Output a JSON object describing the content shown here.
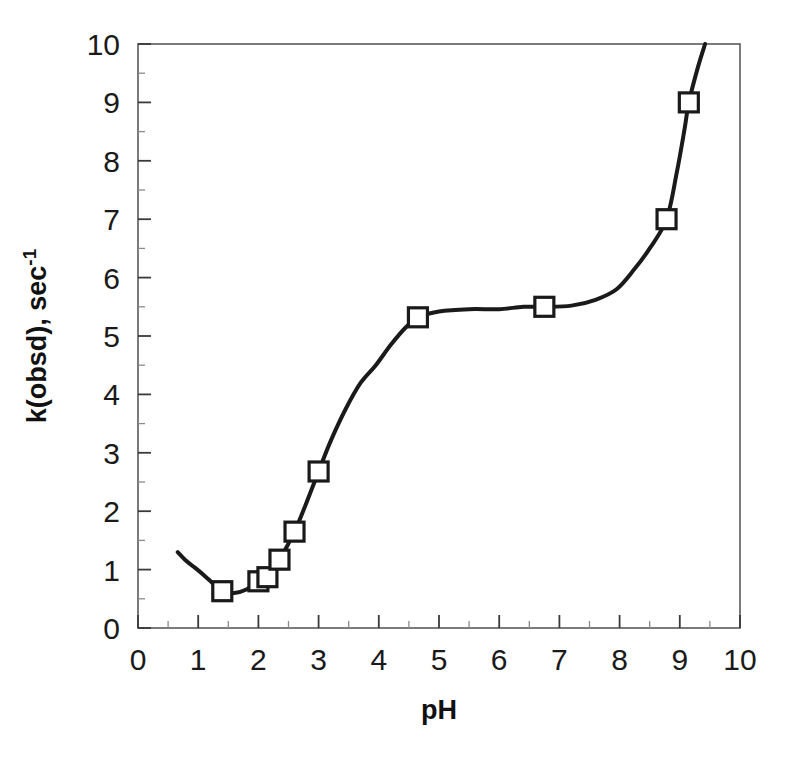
{
  "chart_data": {
    "type": "line",
    "title": "",
    "subtitle": "",
    "xlabel": "pH",
    "ylabel": "k(obsd), sec",
    "ylabel_superscript": "-1",
    "xlim": [
      0,
      10
    ],
    "ylim": [
      0,
      10
    ],
    "xticks": [
      0,
      1,
      2,
      3,
      4,
      5,
      6,
      7,
      8,
      9,
      10
    ],
    "yticks": [
      0,
      1,
      2,
      3,
      4,
      5,
      6,
      7,
      8,
      9,
      10
    ],
    "xtick_labels": [
      "0",
      "1",
      "2",
      "3",
      "4",
      "5",
      "6",
      "7",
      "8",
      "9",
      "10"
    ],
    "ytick_labels": [
      "0",
      "1",
      "2",
      "3",
      "4",
      "5",
      "6",
      "7",
      "8",
      "9",
      "10"
    ],
    "minor_ticks": true,
    "grid": false,
    "legend": null,
    "legend_position": "none",
    "marker": "open-square",
    "marker_color": "#ffffff",
    "marker_edge_color": "#1a1a1a",
    "line_color": "#1a1a1a",
    "line_width": 4,
    "series": [
      {
        "name": "k(obsd)",
        "points": [
          {
            "x": 1.4,
            "y": 0.63
          },
          {
            "x": 2.0,
            "y": 0.8
          },
          {
            "x": 2.15,
            "y": 0.87
          },
          {
            "x": 2.35,
            "y": 1.17
          },
          {
            "x": 2.6,
            "y": 1.65
          },
          {
            "x": 3.0,
            "y": 2.68
          },
          {
            "x": 4.65,
            "y": 5.32
          },
          {
            "x": 6.75,
            "y": 5.5
          },
          {
            "x": 8.78,
            "y": 7.0
          },
          {
            "x": 9.15,
            "y": 9.0
          }
        ]
      }
    ],
    "curve": [
      {
        "x": 0.66,
        "y": 1.3
      },
      {
        "x": 0.8,
        "y": 1.15
      },
      {
        "x": 0.95,
        "y": 1.03
      },
      {
        "x": 1.1,
        "y": 0.9
      },
      {
        "x": 1.25,
        "y": 0.76
      },
      {
        "x": 1.4,
        "y": 0.63
      },
      {
        "x": 1.6,
        "y": 0.6
      },
      {
        "x": 1.8,
        "y": 0.66
      },
      {
        "x": 2.0,
        "y": 0.8
      },
      {
        "x": 2.15,
        "y": 0.87
      },
      {
        "x": 2.35,
        "y": 1.17
      },
      {
        "x": 2.6,
        "y": 1.65
      },
      {
        "x": 2.8,
        "y": 2.15
      },
      {
        "x": 3.0,
        "y": 2.68
      },
      {
        "x": 3.2,
        "y": 3.2
      },
      {
        "x": 3.45,
        "y": 3.75
      },
      {
        "x": 3.7,
        "y": 4.2
      },
      {
        "x": 3.95,
        "y": 4.5
      },
      {
        "x": 4.2,
        "y": 4.85
      },
      {
        "x": 4.45,
        "y": 5.15
      },
      {
        "x": 4.65,
        "y": 5.32
      },
      {
        "x": 5.0,
        "y": 5.42
      },
      {
        "x": 5.5,
        "y": 5.46
      },
      {
        "x": 6.0,
        "y": 5.46
      },
      {
        "x": 6.4,
        "y": 5.5
      },
      {
        "x": 6.75,
        "y": 5.5
      },
      {
        "x": 7.2,
        "y": 5.52
      },
      {
        "x": 7.6,
        "y": 5.62
      },
      {
        "x": 7.95,
        "y": 5.8
      },
      {
        "x": 8.25,
        "y": 6.15
      },
      {
        "x": 8.5,
        "y": 6.5
      },
      {
        "x": 8.78,
        "y": 7.0
      },
      {
        "x": 8.95,
        "y": 7.8
      },
      {
        "x": 9.08,
        "y": 8.55
      },
      {
        "x": 9.15,
        "y": 9.0
      },
      {
        "x": 9.3,
        "y": 9.6
      },
      {
        "x": 9.42,
        "y": 10.0
      }
    ]
  },
  "axes": {
    "x_axis_name": "pH axis",
    "y_axis_name": "k(obsd) axis"
  }
}
